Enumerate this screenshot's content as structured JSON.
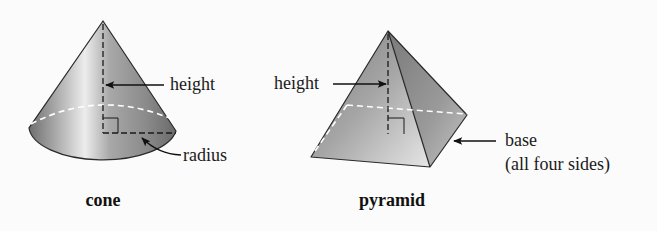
{
  "figures": [
    {
      "id": "cone",
      "caption": "cone",
      "labels": {
        "height": "height",
        "radius": "radius"
      }
    },
    {
      "id": "pyramid",
      "caption": "pyramid",
      "labels": {
        "height": "height",
        "base_line1": "base",
        "base_line2": "(all four sides)"
      }
    }
  ],
  "colors": {
    "background": "#fbfbfb",
    "shape_dark": "#7a7a7a",
    "shape_light": "#e2e2e2",
    "outline": "#2a2a2a",
    "hidden_edge": "#ffffff"
  }
}
